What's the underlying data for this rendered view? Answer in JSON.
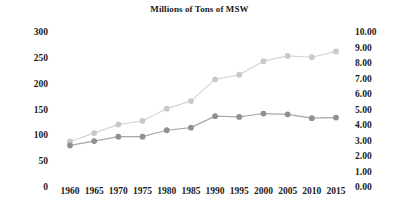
{
  "chart_data": {
    "type": "line",
    "title": "Millions of Tons of MSW",
    "xlabel": "",
    "ylabel": "",
    "grid": false,
    "legend": "none",
    "categories": [
      "1960",
      "1965",
      "1970",
      "1975",
      "1980",
      "1985",
      "1990",
      "1995",
      "2000",
      "2005",
      "2010",
      "2015"
    ],
    "x_tick_labels": [
      "1960",
      "1965",
      "1970",
      "1975",
      "1980",
      "1985",
      "1990",
      "1995",
      "2000",
      "2005",
      "2010",
      "2015"
    ],
    "y_left_tick_labels": [
      "300",
      "250",
      "200",
      "150",
      "100",
      "50",
      "0"
    ],
    "y_right_tick_labels": [
      "10.00",
      "9.00",
      "8.00",
      "7.00",
      "6.00",
      "5.00",
      "4.00",
      "3.00",
      "2.00",
      "1.00",
      "0.00"
    ],
    "ylim_left": [
      0,
      300
    ],
    "ylim_right": [
      0,
      10
    ],
    "series": [
      {
        "name": "Total MSW Generation",
        "axis": "left",
        "color": "#d4d4d4",
        "marker_color": "#c9c9c9",
        "values": [
          88.1,
          104.4,
          121.1,
          127.8,
          151.6,
          166.3,
          208.3,
          217.3,
          243.5,
          253.7,
          251.1,
          262.4
        ]
      },
      {
        "name": "Per Capita Generation",
        "axis": "right",
        "color": "#a8a8a8",
        "marker_color": "#8f8f8f",
        "values": [
          2.68,
          2.96,
          3.25,
          3.25,
          3.66,
          3.83,
          4.57,
          4.52,
          4.74,
          4.69,
          4.44,
          4.48
        ]
      }
    ]
  }
}
